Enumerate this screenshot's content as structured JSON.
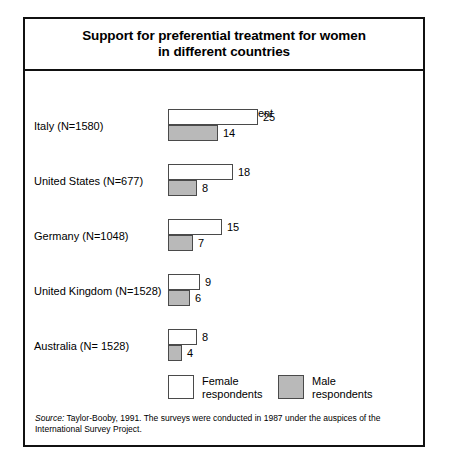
{
  "figure": {
    "title_line_1": "Support for preferential treatment for women",
    "title_line_2": "in different countries",
    "axis_caption": "Percent in agreement",
    "source_label": "Source:",
    "source_text": " Taylor-Booby, 1991. The surveys were conducted in 1987 under the auspices of the International Survey Project."
  },
  "legend": {
    "female_label": "Female\nrespondents",
    "male_label": "Male\nrespondents"
  },
  "chart_data": {
    "type": "bar",
    "title": "Support for preferential treatment for women in different countries",
    "xlabel": "Percent in agreement",
    "ylabel": "",
    "orientation": "horizontal",
    "grid": false,
    "legend_position": "bottom",
    "xlim": [
      0,
      25
    ],
    "categories": [
      "Italy (N=1580)",
      "United States (N=677)",
      "Germany (N=1048)",
      "United Kingdom (N=1528)",
      "Australia (N= 1528)"
    ],
    "series": [
      {
        "name": "Female respondents",
        "color": "#ffffff",
        "values": [
          25,
          18,
          15,
          9,
          8
        ]
      },
      {
        "name": "Male respondents",
        "color": "#b9b9b9",
        "values": [
          14,
          8,
          7,
          6,
          4
        ]
      }
    ],
    "annotation": "Source: Taylor-Booby, 1991. The surveys were conducted in 1987 under the auspices of the International Survey Project."
  }
}
